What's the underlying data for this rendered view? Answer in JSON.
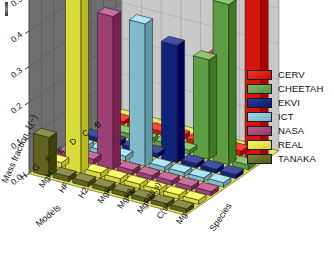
{
  "figure": {
    "background": "#ffffff",
    "floor_color": "#e8e86a",
    "back_wall_color": "#6e6e6e",
    "right_wall_color": "#c9c9c9",
    "grid_line_color": "#4a4a4a"
  },
  "chart_data": {
    "type": "bar",
    "title": "",
    "projection": "3d",
    "xlabel": "Models",
    "ylabel": "Species",
    "zlabel": "Mass fraction, ξ(−)",
    "ylabel_axis": "Mass fraction, ξ(−)",
    "zlim": [
      0.0,
      0.55
    ],
    "ztick_labels": [
      "0.0",
      "0.1",
      "0.2",
      "0.3",
      "0.4",
      "0.5"
    ],
    "ztick_values": [
      0.0,
      0.1,
      0.2,
      0.3,
      0.4,
      0.5
    ],
    "grid": true,
    "legend_position": "right",
    "categories_models": [
      "H",
      "G",
      "F",
      "E",
      "D",
      "C",
      "B"
    ],
    "categories_species": [
      "MgH",
      "HF",
      "H2",
      "MgF",
      "MgF2",
      "MgF2(l,s)",
      "C(s)",
      "Mg"
    ],
    "legend": [
      {
        "name": "CERV",
        "color": "#e02314"
      },
      {
        "name": "CHEETAH",
        "color": "#6aa84f"
      },
      {
        "name": "EKVI",
        "color": "#1c2f87"
      },
      {
        "name": "ICT",
        "color": "#8ec6d9"
      },
      {
        "name": "NASA",
        "color": "#a84b7e"
      },
      {
        "name": "REAL",
        "color": "#e6e84a"
      },
      {
        "name": "TANAKA",
        "color": "#6b6f28"
      }
    ],
    "series": [
      {
        "name": "CERV",
        "color": "#e02314",
        "values": [
          0.01,
          0.012,
          0.01,
          0.012,
          0.01,
          0.26,
          0.015,
          0.52
        ]
      },
      {
        "name": "CHEETAH",
        "color": "#6aa84f",
        "values": [
          0.012,
          0.013,
          0.012,
          0.014,
          0.012,
          0.28,
          0.45,
          0.014
        ]
      },
      {
        "name": "EKVI",
        "color": "#1c2f87",
        "values": [
          0.012,
          0.014,
          0.012,
          0.013,
          0.33,
          0.013,
          0.012,
          0.012
        ]
      },
      {
        "name": "ICT",
        "color": "#8ec6d9",
        "values": [
          0.013,
          0.014,
          0.014,
          0.4,
          0.013,
          0.012,
          0.012,
          0.013
        ]
      },
      {
        "name": "NASA",
        "color": "#a84b7e",
        "values": [
          0.014,
          0.015,
          0.43,
          0.014,
          0.013,
          0.013,
          0.012,
          0.012
        ]
      },
      {
        "name": "REAL",
        "color": "#e6e84a",
        "values": [
          0.015,
          0.5,
          0.015,
          0.014,
          0.013,
          0.013,
          0.012,
          0.012
        ]
      },
      {
        "name": "TANAKA",
        "color": "#6b6f28",
        "values": [
          0.11,
          0.015,
          0.014,
          0.013,
          0.013,
          0.012,
          0.012,
          0.012
        ]
      }
    ]
  }
}
